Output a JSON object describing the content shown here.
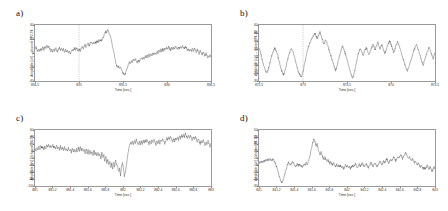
{
  "figure": {
    "background": "#ffffff",
    "trace_color": "#4f4f4f",
    "axis_color": "#9a9a9a",
    "marker_color": "#8a8a8a"
  },
  "chart_data": [
    {
      "type": "line",
      "panel": "a)",
      "title": "",
      "xlabel": "Time [sec.]",
      "ylabel": "Amplitude [uV] -- channel FP2-F4",
      "xlim": [
        834.5,
        836.5
      ],
      "ylim": [
        -40,
        40
      ],
      "xticks": [
        "834.5",
        "835",
        "835.5",
        "836",
        "836.5"
      ],
      "xtickvals": [
        834.5,
        835,
        835.5,
        836,
        836.5
      ],
      "yticks": [
        "40",
        "20",
        "0",
        "-20",
        "-40"
      ],
      "ytickvals": [
        40,
        20,
        0,
        -20,
        -40
      ],
      "grid": false,
      "legend": "none",
      "marker_x": 835.0,
      "seed": 11,
      "values": [
        6,
        9,
        5,
        2,
        6,
        3,
        7,
        4,
        8,
        5,
        9,
        6,
        11,
        8,
        10,
        6,
        3,
        5,
        2,
        6,
        3,
        7,
        4,
        2,
        5,
        8,
        4,
        7,
        3,
        6,
        2,
        5,
        1,
        4,
        0,
        3,
        -1,
        2,
        5,
        3,
        7,
        4,
        8,
        5,
        2,
        6,
        3,
        7,
        10,
        6,
        9,
        12,
        8,
        11,
        14,
        10,
        13,
        16,
        12,
        15,
        13,
        16,
        14,
        17,
        15,
        18,
        16,
        19,
        17,
        21,
        24,
        28,
        31,
        29,
        33,
        30,
        27,
        22,
        16,
        9,
        2,
        -5,
        -12,
        -18,
        -21,
        -19,
        -22,
        -20,
        -24,
        -27,
        -30,
        -32,
        -29,
        -25,
        -21,
        -17,
        -13,
        -15,
        -11,
        -14,
        -9,
        -12,
        -8,
        -11,
        -14,
        -10,
        -13,
        -9,
        -6,
        -9,
        -5,
        -8,
        -4,
        -7,
        -3,
        -6,
        -2,
        -5,
        -1,
        -4,
        0,
        -3,
        1,
        -2,
        3,
        0,
        4,
        1,
        5,
        2,
        6,
        3,
        7,
        4,
        8,
        5,
        9,
        6,
        4,
        7,
        5,
        8,
        6,
        9,
        7,
        5,
        8,
        6,
        9,
        7,
        10,
        8,
        6,
        9,
        7,
        4,
        6,
        3,
        5,
        2,
        6,
        3,
        7,
        4,
        1,
        5,
        2,
        -1,
        3,
        0,
        -3,
        1,
        -2,
        -5,
        -1,
        -4,
        -7,
        -3,
        -6,
        -2
      ]
    },
    {
      "type": "line",
      "panel": "b)",
      "title": "",
      "xlabel": "Time [sec.]",
      "ylabel": "Amplitude [uV] -- channel P4-O2",
      "xlim": [
        872.5,
        874.5
      ],
      "ylim": [
        -30,
        40
      ],
      "xticks": [
        "872.5",
        "873",
        "873.5",
        "874",
        "874.5"
      ],
      "xtickvals": [
        872.5,
        873,
        873.5,
        874,
        874.5
      ],
      "yticks": [
        "40",
        "30",
        "20",
        "10",
        "0",
        "-10",
        "-20",
        "-30"
      ],
      "ytickvals": [
        40,
        30,
        20,
        10,
        0,
        -10,
        -20,
        -30
      ],
      "grid": false,
      "legend": "none",
      "marker_x": 873.0,
      "seed": 23,
      "values": [
        12,
        8,
        3,
        -2,
        -7,
        -11,
        -15,
        -18,
        -20,
        -17,
        -13,
        -8,
        -3,
        2,
        6,
        9,
        11,
        9,
        6,
        2,
        -3,
        -8,
        -13,
        -17,
        -20,
        -22,
        -19,
        -14,
        -9,
        -4,
        1,
        5,
        8,
        10,
        8,
        5,
        1,
        -4,
        -9,
        -14,
        -18,
        -21,
        -23,
        -25,
        -22,
        -17,
        -11,
        -5,
        1,
        7,
        12,
        16,
        19,
        22,
        24,
        26,
        28,
        30,
        27,
        23,
        25,
        28,
        31,
        28,
        24,
        20,
        16,
        19,
        22,
        18,
        14,
        10,
        6,
        2,
        -2,
        -6,
        -10,
        -14,
        -17,
        -13,
        -8,
        -3,
        2,
        7,
        11,
        14,
        11,
        7,
        3,
        -1,
        -5,
        -10,
        -15,
        -19,
        -23,
        -26,
        -24,
        -19,
        -13,
        -7,
        -1,
        4,
        8,
        11,
        8,
        5,
        2,
        6,
        9,
        12,
        9,
        6,
        3,
        7,
        10,
        13,
        16,
        13,
        9,
        12,
        15,
        18,
        14,
        10,
        13,
        16,
        12,
        8,
        4,
        8,
        12,
        15,
        18,
        20,
        17,
        13,
        9,
        5,
        9,
        13,
        16,
        19,
        16,
        12,
        8,
        4,
        0,
        -4,
        -8,
        -12,
        -15,
        -18,
        -14,
        -10,
        -6,
        -2,
        2,
        6,
        10,
        13,
        16,
        13,
        9,
        5,
        1,
        -3,
        -7,
        -10,
        -6,
        -2,
        2,
        6,
        9,
        12,
        9,
        5,
        1,
        -2,
        2,
        5
      ]
    },
    {
      "type": "line",
      "panel": "c)",
      "title": "",
      "xlabel": "Time [sec.]",
      "ylabel": "Amplitude [uV] -- channel T4-T6",
      "xlim": [
        881,
        883
      ],
      "ylim": [
        -100,
        60
      ],
      "xticks": [
        "881",
        "881.2",
        "881.4",
        "881.6",
        "881.8",
        "882",
        "882.2",
        "882.4",
        "882.6",
        "882.8",
        "883"
      ],
      "xtickvals": [
        881,
        881.2,
        881.4,
        881.6,
        881.8,
        882,
        882.2,
        882.4,
        882.6,
        882.8,
        883
      ],
      "yticks": [
        "60",
        "40",
        "20",
        "0",
        "-20",
        "-40",
        "-60",
        "-80",
        "-100"
      ],
      "ytickvals": [
        60,
        40,
        20,
        0,
        -20,
        -40,
        -60,
        -80,
        -100
      ],
      "grid": false,
      "legend": "none",
      "marker_x": null,
      "seed": 37,
      "values": [
        8,
        2,
        10,
        4,
        14,
        6,
        16,
        8,
        12,
        4,
        14,
        6,
        18,
        10,
        20,
        12,
        16,
        8,
        18,
        10,
        14,
        6,
        16,
        8,
        12,
        2,
        14,
        4,
        10,
        0,
        12,
        2,
        8,
        -2,
        10,
        0,
        6,
        -4,
        8,
        -2,
        4,
        -6,
        6,
        -4,
        10,
        0,
        12,
        2,
        8,
        -2,
        4,
        -8,
        6,
        -6,
        2,
        -10,
        4,
        -8,
        0,
        -12,
        2,
        -10,
        -4,
        -16,
        -2,
        -14,
        -8,
        -22,
        -6,
        -20,
        -12,
        -28,
        -18,
        -34,
        -24,
        -40,
        -30,
        -48,
        -36,
        -52,
        -30,
        -44,
        -26,
        -38,
        -44,
        -58,
        -50,
        -70,
        -44,
        -34,
        -52,
        -72,
        -60,
        -40,
        -20,
        0,
        14,
        24,
        18,
        28,
        20,
        30,
        22,
        32,
        24,
        16,
        26,
        18,
        28,
        20,
        30,
        22,
        32,
        24,
        34,
        26,
        20,
        30,
        22,
        32,
        24,
        34,
        26,
        18,
        28,
        20,
        30,
        22,
        34,
        26,
        36,
        28,
        20,
        30,
        38,
        30,
        40,
        32,
        42,
        34,
        26,
        36,
        28,
        38,
        30,
        40,
        32,
        44,
        36,
        46,
        38,
        48,
        40,
        50,
        42,
        34,
        44,
        36,
        46,
        38,
        30,
        40,
        32,
        42,
        34,
        26,
        36,
        28,
        20,
        30,
        22,
        32,
        24,
        16,
        26,
        18,
        28,
        20,
        12,
        22
      ]
    },
    {
      "type": "line",
      "panel": "d)",
      "title": "",
      "xlabel": "Time [sec.]",
      "ylabel": "Amplitude [uV] -- channel P4-O2",
      "xlim": [
        841,
        843
      ],
      "ylim": [
        -30,
        50
      ],
      "xticks": [
        "841",
        "841.2",
        "841.4",
        "841.6",
        "841.8",
        "842",
        "842.2",
        "842.4",
        "842.6",
        "842.8",
        "843"
      ],
      "xtickvals": [
        841,
        841.2,
        841.4,
        841.6,
        841.8,
        842,
        842.2,
        842.4,
        842.6,
        842.8,
        843
      ],
      "yticks": [
        "50",
        "40",
        "30",
        "20",
        "10",
        "0",
        "-10",
        "-20",
        "-30"
      ],
      "ytickvals": [
        50,
        40,
        30,
        20,
        10,
        0,
        -10,
        -20,
        -30
      ],
      "grid": false,
      "legend": "none",
      "marker_x": null,
      "seed": 53,
      "values": [
        2,
        5,
        3,
        6,
        4,
        7,
        5,
        8,
        6,
        9,
        7,
        10,
        8,
        6,
        9,
        7,
        4,
        1,
        -3,
        -8,
        -13,
        -18,
        -22,
        -25,
        -23,
        -19,
        -14,
        -9,
        -4,
        0,
        4,
        2,
        -1,
        2,
        5,
        3,
        0,
        -3,
        -1,
        2,
        -1,
        1,
        -2,
        0,
        -3,
        -1,
        2,
        0,
        3,
        1,
        4,
        8,
        14,
        21,
        28,
        34,
        38,
        33,
        27,
        30,
        24,
        19,
        15,
        18,
        14,
        11,
        8,
        11,
        8,
        5,
        8,
        5,
        2,
        5,
        2,
        0,
        3,
        0,
        -2,
        1,
        -2,
        0,
        -3,
        -1,
        -4,
        -2,
        -5,
        -3,
        0,
        -3,
        -1,
        -4,
        -2,
        -5,
        -3,
        0,
        -3,
        -1,
        2,
        -1,
        -4,
        -2,
        1,
        -2,
        0,
        3,
        0,
        -3,
        -1,
        2,
        -1,
        -4,
        -2,
        1,
        4,
        1,
        -2,
        0,
        3,
        0,
        -3,
        0,
        3,
        6,
        3,
        0,
        3,
        6,
        3,
        6,
        9,
        6,
        3,
        6,
        9,
        6,
        9,
        12,
        9,
        6,
        9,
        12,
        9,
        12,
        15,
        12,
        9,
        12,
        15,
        18,
        15,
        12,
        9,
        12,
        9,
        6,
        9,
        6,
        3,
        6,
        3,
        0,
        3,
        0,
        -3,
        0,
        -3,
        -6,
        -3,
        -6,
        -3,
        0,
        -3,
        -6,
        -3,
        -6,
        -9,
        -6,
        -3,
        -6
      ]
    }
  ]
}
